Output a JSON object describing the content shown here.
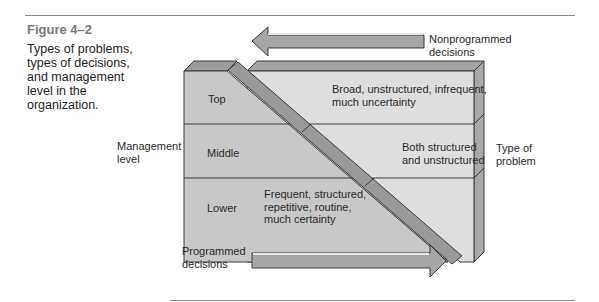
{
  "figure": {
    "number": "Figure 4–2",
    "caption": "Types of problems, types of decisions, and management level in the organization."
  },
  "arrows": {
    "top": {
      "label_line1": "Nonprogrammed",
      "label_line2": "decisions",
      "direction": "left"
    },
    "bottom": {
      "label_line1": "Programmed",
      "label_line2": "decisions",
      "direction": "right"
    }
  },
  "axes": {
    "left_label_line1": "Management",
    "left_label_line2": "level",
    "right_label_line1": "Type of",
    "right_label_line2": "problem"
  },
  "levels": [
    {
      "name": "Top",
      "problem_line1": "Broad, unstructured, infrequent,",
      "problem_line2": "much uncertainty",
      "problem_line3": ""
    },
    {
      "name": "Middle",
      "problem_line1": "Both structured",
      "problem_line2": "and unstructured",
      "problem_line3": ""
    },
    {
      "name": "Lower",
      "problem_line1": "Frequent, structured,",
      "problem_line2": "repetitive, routine,",
      "problem_line3": "much certainty"
    }
  ],
  "colors": {
    "left_face": "#c8c8c8",
    "right_face": "#dedede",
    "top_face": "#9c9c9c",
    "side_face": "#a8a8a8",
    "diagonal_bar": "#9a9a9a",
    "arrow_fill": "#a6a6a6",
    "outline": "#3a3a3a"
  }
}
